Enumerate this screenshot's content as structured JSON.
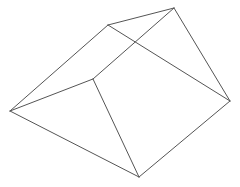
{
  "diagram": {
    "type": "wireframe-solid",
    "background": "#ffffff",
    "stroke_color": "#555555",
    "stroke_width": 1,
    "vertices": {
      "A": [
        108,
        25
      ],
      "B": [
        174,
        8
      ],
      "C": [
        10,
        111
      ],
      "D": [
        93,
        79
      ],
      "E": [
        230,
        101
      ],
      "F": [
        139,
        177
      ]
    },
    "edges": [
      [
        "A",
        "B"
      ],
      [
        "A",
        "C"
      ],
      [
        "A",
        "E"
      ],
      [
        "B",
        "D"
      ],
      [
        "B",
        "E"
      ],
      [
        "C",
        "D"
      ],
      [
        "C",
        "F"
      ],
      [
        "D",
        "F"
      ],
      [
        "E",
        "F"
      ]
    ]
  }
}
